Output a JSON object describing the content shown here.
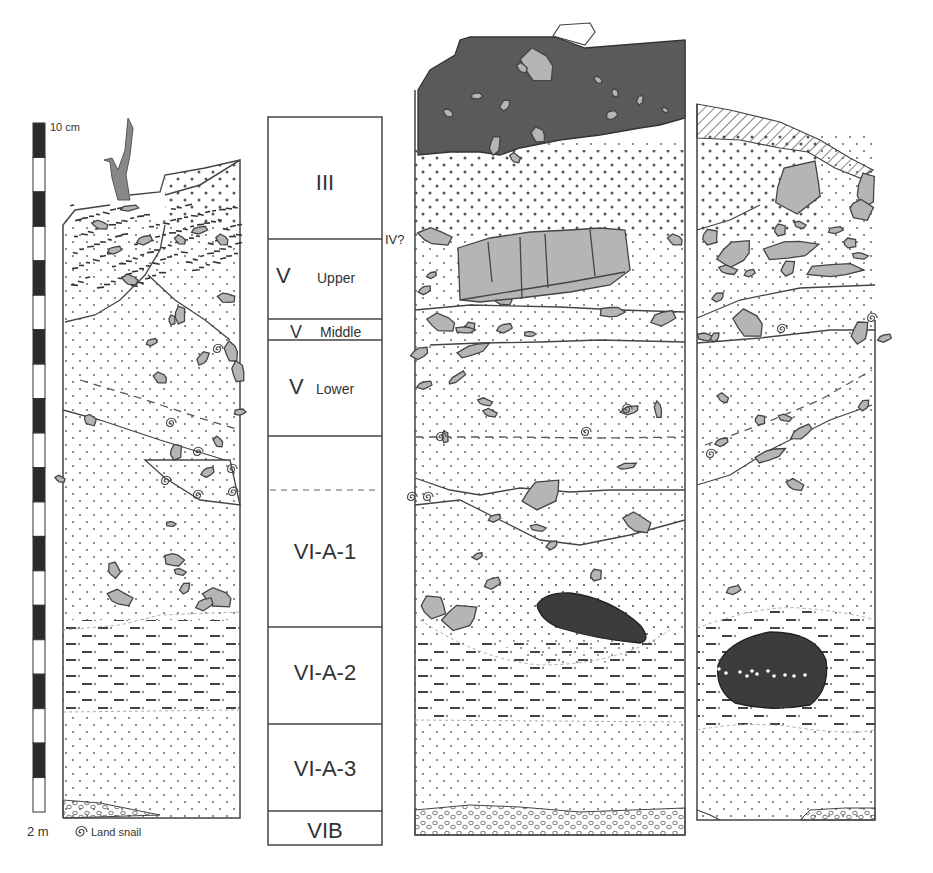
{
  "scale_bar": {
    "top_label": "10 cm",
    "bottom_label": "2 m",
    "segments": 20
  },
  "legend": {
    "items": [
      {
        "icon": "land-snail-icon",
        "label": "Land snail"
      }
    ]
  },
  "stratigraphic_column": {
    "layers": [
      {
        "id": "III",
        "main": "III",
        "sub": ""
      },
      {
        "id": "V-upper",
        "main": "V",
        "sub": "Upper"
      },
      {
        "id": "V-middle",
        "main": "V",
        "sub": "Middle"
      },
      {
        "id": "V-lower",
        "main": "V",
        "sub": "Lower"
      },
      {
        "id": "VI-A-1",
        "main": "VI-A-1",
        "sub": ""
      },
      {
        "id": "VI-A-2",
        "main": "VI-A-2",
        "sub": ""
      },
      {
        "id": "VI-A-3",
        "main": "VI-A-3",
        "sub": ""
      },
      {
        "id": "VIB",
        "main": "VIB",
        "sub": ""
      }
    ],
    "side_annotation": "IV?"
  },
  "sections": [
    {
      "id": "left-profile"
    },
    {
      "id": "center-profile"
    },
    {
      "id": "right-profile"
    }
  ],
  "fill_patterns": {
    "sand": "dotted",
    "silt": "dashed",
    "gravel": "circles",
    "topsoil": "hatched",
    "dark_layer": "#5a5a5a",
    "stone": "#b5b5b5",
    "charcoal": "#3c3c3c"
  }
}
